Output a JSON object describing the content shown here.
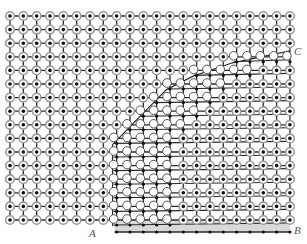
{
  "diagram": {
    "grid": {
      "cols": 22,
      "rows": 16,
      "x0": 10,
      "y0": 16,
      "dx": 13.33,
      "dy": 13.6
    },
    "colors": {
      "line": "#2a2a2a",
      "atom_ring": "#9a9a9a",
      "atom_core": "#111111",
      "slipped_fill": "#ffffff",
      "slipped_stroke": "#555555",
      "shade": "#d9d9d9"
    },
    "slip_boundary": {
      "description": "Slipped region lies right/below curve from A to C; above plane the atoms are displaced (white circles)",
      "row_start_col": [
        22,
        22,
        22,
        17,
        14,
        12,
        11,
        10,
        9,
        8,
        8,
        8,
        8,
        8,
        8,
        8
      ]
    },
    "labels": {
      "A": "A",
      "B": "B",
      "C": "C"
    }
  }
}
